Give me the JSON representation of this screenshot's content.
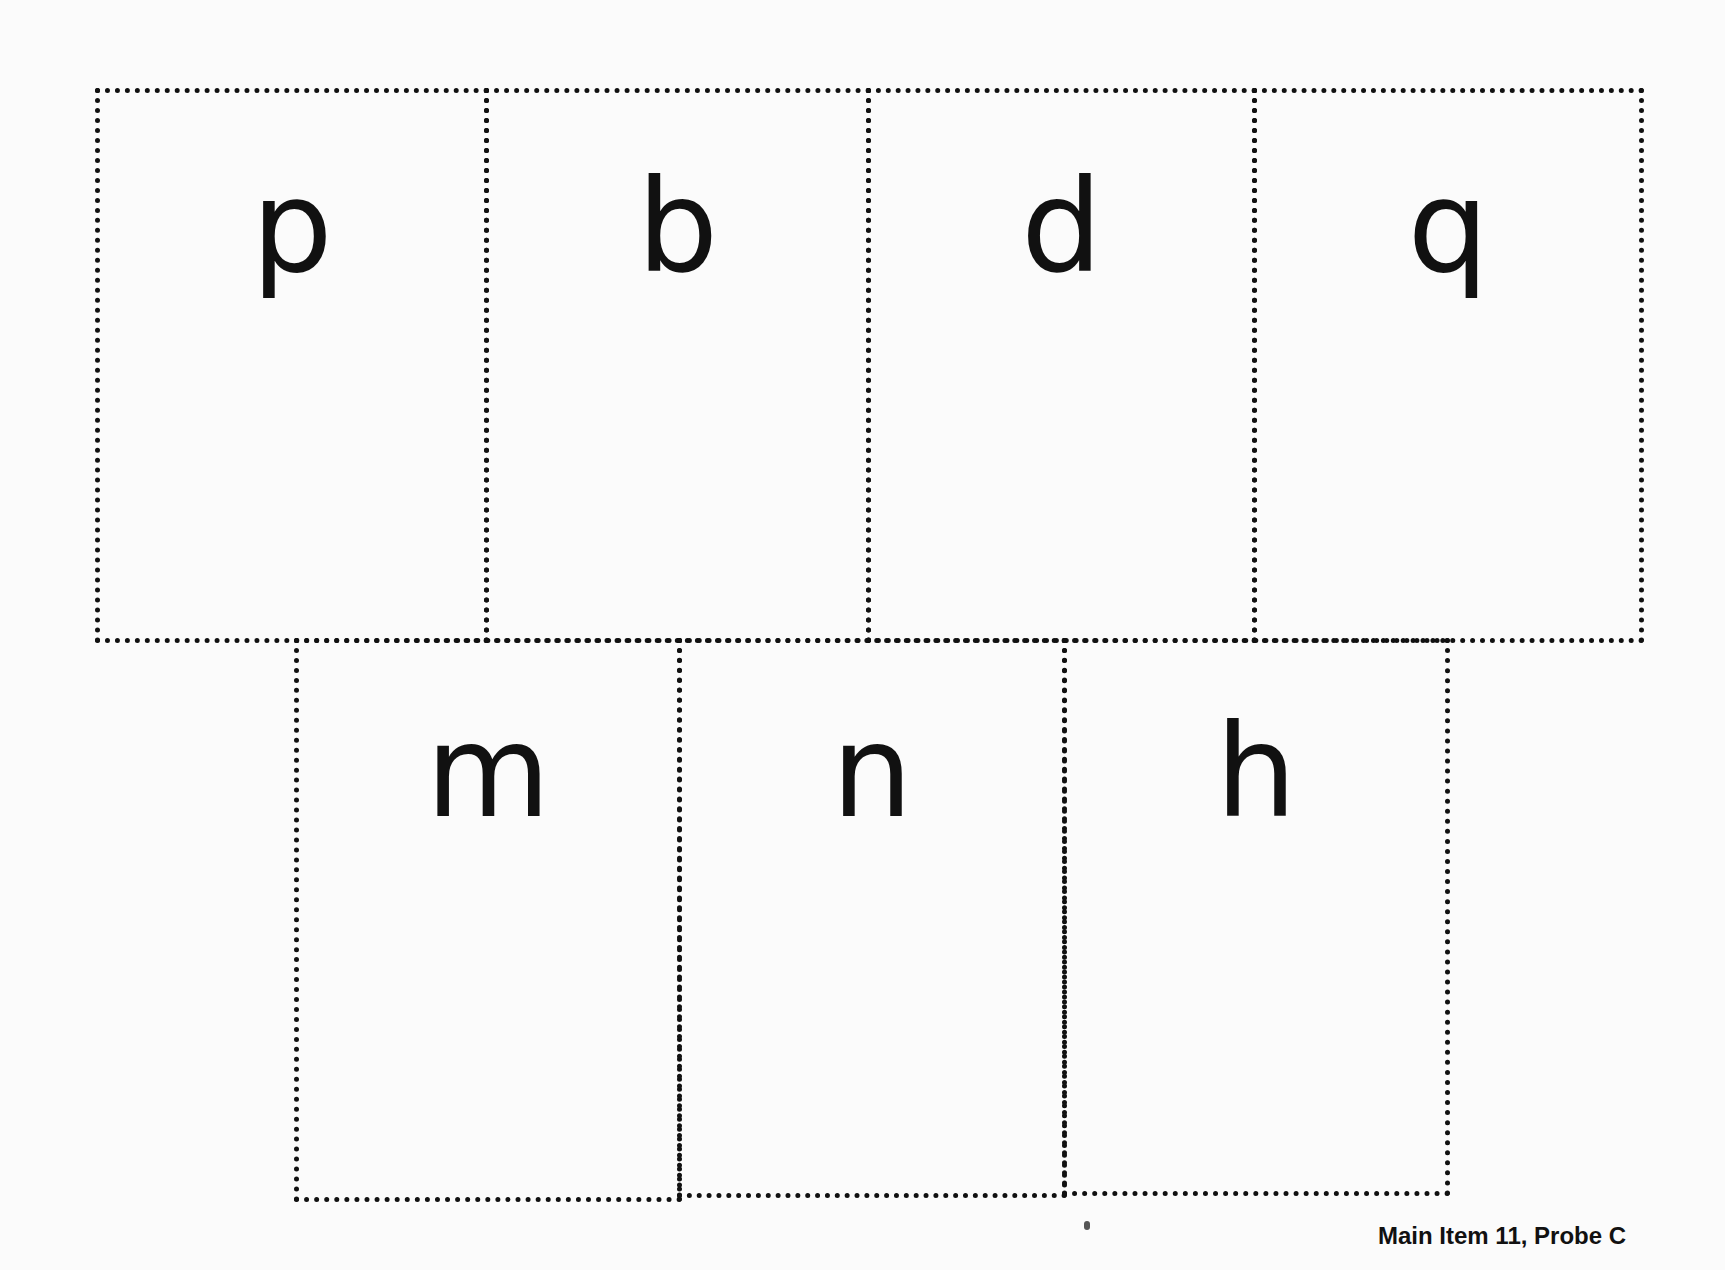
{
  "cards": {
    "top_row": [
      {
        "letter": "p"
      },
      {
        "letter": "b"
      },
      {
        "letter": "d"
      },
      {
        "letter": "q"
      }
    ],
    "bottom_row": [
      {
        "letter": "m"
      },
      {
        "letter": "n"
      },
      {
        "letter": "h"
      }
    ]
  },
  "footer": {
    "label": "Main Item 11, Probe C"
  }
}
